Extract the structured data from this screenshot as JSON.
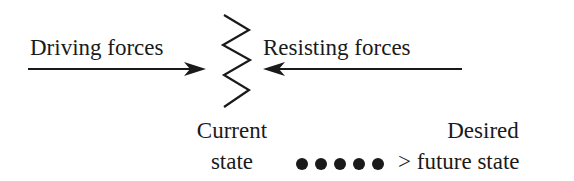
{
  "diagram": {
    "driving_forces": {
      "label": "Driving forces",
      "arrow_direction": "right"
    },
    "resisting_forces": {
      "label": "Resisting forces",
      "arrow_direction": "left"
    },
    "current_state": {
      "line1": "Current",
      "line2": "state"
    },
    "desired_state": {
      "line1": "Desired",
      "line2": "> future state"
    },
    "dotted_path": {
      "dot_count": 5
    },
    "colors": {
      "ink": "#1a1a1a",
      "background": "#ffffff"
    }
  }
}
